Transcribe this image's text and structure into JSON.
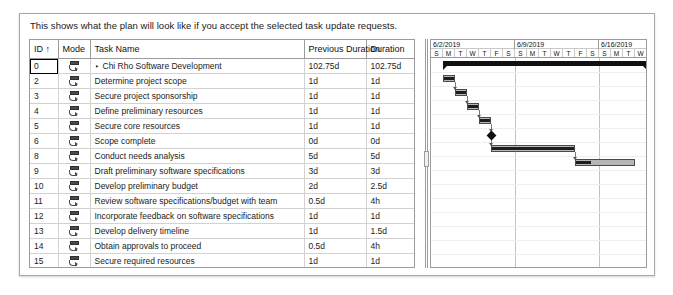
{
  "dialog": {
    "intro_text": "This shows what the plan will look like if you accept the selected task update requests."
  },
  "grid": {
    "columns": [
      {
        "key": "id",
        "label": "ID ↑"
      },
      {
        "key": "mode",
        "label": "Mode"
      },
      {
        "key": "task",
        "label": "Task Name"
      },
      {
        "key": "prev",
        "label": "Previous Duration"
      },
      {
        "key": "dur",
        "label": "Duration"
      }
    ],
    "mode_icon": "auto-schedule-icon",
    "expander_glyph": "‣",
    "rows": [
      {
        "id": "0",
        "task": "Chi Rho Software Development",
        "prev": "102.75d",
        "dur": "102.75d",
        "level": 0,
        "summary": true,
        "focused": true
      },
      {
        "id": "2",
        "task": "Determine project scope",
        "prev": "1d",
        "dur": "1d",
        "level": 1,
        "summary": false,
        "focused": false
      },
      {
        "id": "3",
        "task": "Secure project sponsorship",
        "prev": "1d",
        "dur": "1d",
        "level": 1,
        "summary": false,
        "focused": false
      },
      {
        "id": "4",
        "task": "Define preliminary resources",
        "prev": "1d",
        "dur": "1d",
        "level": 1,
        "summary": false,
        "focused": false
      },
      {
        "id": "5",
        "task": "Secure core resources",
        "prev": "1d",
        "dur": "1d",
        "level": 1,
        "summary": false,
        "focused": false
      },
      {
        "id": "6",
        "task": "Scope complete",
        "prev": "0d",
        "dur": "0d",
        "level": 1,
        "summary": false,
        "focused": false
      },
      {
        "id": "8",
        "task": "Conduct needs analysis",
        "prev": "5d",
        "dur": "5d",
        "level": 1,
        "summary": false,
        "focused": false
      },
      {
        "id": "9",
        "task": "Draft preliminary software specifications",
        "prev": "3d",
        "dur": "3d",
        "level": 1,
        "summary": false,
        "focused": false
      },
      {
        "id": "10",
        "task": "Develop preliminary budget",
        "prev": "2d",
        "dur": "2.5d",
        "level": 1,
        "summary": false,
        "focused": false
      },
      {
        "id": "11",
        "task": "Review software specifications/budget with team",
        "prev": "0.5d",
        "dur": "4h",
        "level": 1,
        "summary": false,
        "focused": false
      },
      {
        "id": "12",
        "task": "Incorporate feedback on software specifications",
        "prev": "1d",
        "dur": "1d",
        "level": 1,
        "summary": false,
        "focused": false
      },
      {
        "id": "13",
        "task": "Develop delivery timeline",
        "prev": "1d",
        "dur": "1.5d",
        "level": 1,
        "summary": false,
        "focused": false
      },
      {
        "id": "14",
        "task": "Obtain approvals to proceed",
        "prev": "0.5d",
        "dur": "4h",
        "level": 1,
        "summary": false,
        "focused": false
      },
      {
        "id": "15",
        "task": "Secure required resources",
        "prev": "1d",
        "dur": "1d",
        "level": 1,
        "summary": false,
        "focused": false
      },
      {
        "id": "16",
        "task": "Analysis complete",
        "prev": "0d",
        "dur": "0d",
        "level": 1,
        "summary": false,
        "focused": false
      },
      {
        "id": "18",
        "task": "Review preliminary software specifications",
        "prev": "2d",
        "dur": "2d",
        "level": 1,
        "summary": false,
        "focused": false
      }
    ]
  },
  "gantt": {
    "weeks": [
      {
        "label": "6/2/2019",
        "days": [
          "S",
          "M",
          "T",
          "W",
          "T",
          "F",
          "S"
        ]
      },
      {
        "label": "6/9/2019",
        "days": [
          "S",
          "M",
          "T",
          "W",
          "T",
          "F",
          "S"
        ]
      },
      {
        "label": "6/16/2019",
        "days": [
          "S",
          "M",
          "T",
          "W"
        ]
      }
    ],
    "day_width": 12,
    "row_height": 14,
    "bars": [
      {
        "row": 0,
        "type": "summary",
        "start_day": 1.0,
        "length_days": 17.0,
        "progress": 0
      },
      {
        "row": 1,
        "type": "task",
        "start_day": 1.0,
        "length_days": 1.0,
        "progress": 1.0
      },
      {
        "row": 2,
        "type": "task",
        "start_day": 2.0,
        "length_days": 1.0,
        "progress": 1.0
      },
      {
        "row": 3,
        "type": "task",
        "start_day": 3.0,
        "length_days": 1.0,
        "progress": 1.0
      },
      {
        "row": 4,
        "type": "task",
        "start_day": 4.0,
        "length_days": 1.0,
        "progress": 1.0
      },
      {
        "row": 5,
        "type": "milestone",
        "start_day": 5.0,
        "length_days": 0,
        "progress": 0
      },
      {
        "row": 6,
        "type": "task",
        "start_day": 5.0,
        "length_days": 7.0,
        "progress": 1.0
      },
      {
        "row": 7,
        "type": "task",
        "start_day": 12.0,
        "length_days": 5.0,
        "progress": 0.28
      }
    ],
    "links": [
      {
        "from_row": 1,
        "to_row": 2,
        "day": 2.0
      },
      {
        "from_row": 2,
        "to_row": 3,
        "day": 3.0
      },
      {
        "from_row": 3,
        "to_row": 4,
        "day": 4.0
      },
      {
        "from_row": 4,
        "to_row": 5,
        "day": 5.0
      },
      {
        "from_row": 5,
        "to_row": 6,
        "day": 5.0
      },
      {
        "from_row": 6,
        "to_row": 7,
        "day": 12.0
      }
    ]
  },
  "colors": {
    "summary_bar": "#111111",
    "task_bar_fill": "#b6b6b6",
    "task_bar_border": "#4a4a4a",
    "progress": "#1d1d1d",
    "grid_line": "#d2d2d2",
    "header_line": "#9b9b9b",
    "dialog_border": "#a8a8a8",
    "text": "#1b1b1b"
  }
}
